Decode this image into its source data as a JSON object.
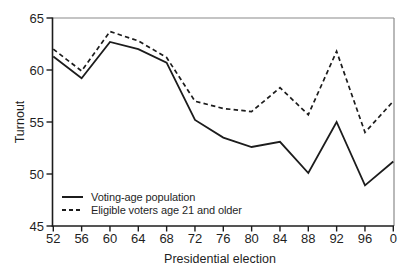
{
  "chart_data": {
    "type": "line",
    "xlabel": "Presidential election",
    "ylabel": "Turnout",
    "x_labels": [
      "52",
      "56",
      "60",
      "64",
      "68",
      "72",
      "76",
      "80",
      "84",
      "88",
      "92",
      "96",
      "0"
    ],
    "yticks": [
      45,
      50,
      55,
      60,
      65
    ],
    "ylim": [
      45,
      65
    ],
    "grid": false,
    "legend_position": "lower-left",
    "series": [
      {
        "name": "Voting-age population",
        "style": "solid",
        "values": [
          61.3,
          59.2,
          62.7,
          62.0,
          60.7,
          55.2,
          53.5,
          52.6,
          53.1,
          50.1,
          55.0,
          48.9,
          51.2
        ]
      },
      {
        "name": "Eligible voters age 21 and older",
        "style": "dashed",
        "values": [
          62.0,
          59.9,
          63.7,
          62.8,
          61.2,
          57.0,
          56.3,
          56.0,
          58.3,
          55.7,
          61.8,
          54.0,
          57.0
        ]
      }
    ],
    "colors": {
      "line": "#1c1c1c",
      "frame": "#8a8a8a",
      "background": "#ffffff"
    }
  }
}
